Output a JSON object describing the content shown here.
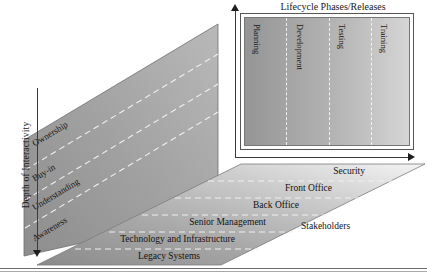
{
  "diagram": {
    "title_lifecycle": "Lifecycle Phases/Releases",
    "axis_vertical_label": "Depth of Interactivity",
    "axis_floor_label": "Stakeholders",
    "colors": {
      "panel_gradient_start": "#959595",
      "panel_gradient_end": "#d6d6d6",
      "wall_gradient_start": "#8f8f8f",
      "wall_gradient_end": "#d2d2d2",
      "floor_dark": "#8a8a8a",
      "floor_light": "#ffffff",
      "divider": "#f2f2f2",
      "axis_stroke": "#3a3a3a",
      "text": "#131313"
    }
  },
  "lifecycle_phases": [
    {
      "label": "Planning"
    },
    {
      "label": "Development"
    },
    {
      "label": "Testing"
    },
    {
      "label": "Training"
    }
  ],
  "depth_of_interactivity": [
    {
      "label": "Ownership"
    },
    {
      "label": "Buy-in"
    },
    {
      "label": "Understanding"
    },
    {
      "label": "Awareness"
    }
  ],
  "stakeholders": [
    {
      "label": "Security"
    },
    {
      "label": "Front Office"
    },
    {
      "label": "Back Office"
    },
    {
      "label": "Senior Management"
    },
    {
      "label": "Technology and Infrastructure"
    },
    {
      "label": "Legacy Systems"
    }
  ]
}
